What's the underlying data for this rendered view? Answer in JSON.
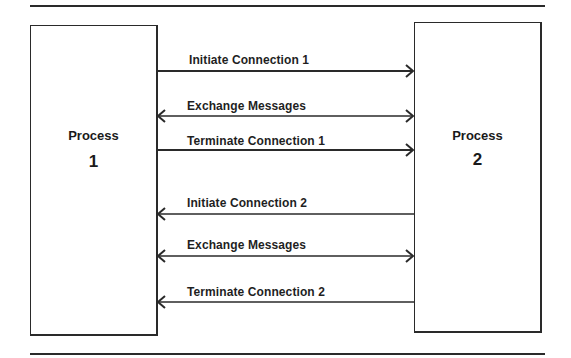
{
  "diagram": {
    "type": "sequence",
    "process_left": {
      "title": "Process",
      "number": "1"
    },
    "process_right": {
      "title": "Process",
      "number": "2"
    },
    "messages": [
      {
        "label": "Initiate Connection 1",
        "direction": "right"
      },
      {
        "label": "Exchange Messages",
        "direction": "both"
      },
      {
        "label": "Terminate Connection 1",
        "direction": "right"
      },
      {
        "label": "Initiate Connection 2",
        "direction": "left"
      },
      {
        "label": "Exchange Messages",
        "direction": "both"
      },
      {
        "label": "Terminate Connection 2",
        "direction": "left"
      }
    ],
    "colors": {
      "line": "#2a2a2a",
      "background": "#ffffff"
    }
  }
}
